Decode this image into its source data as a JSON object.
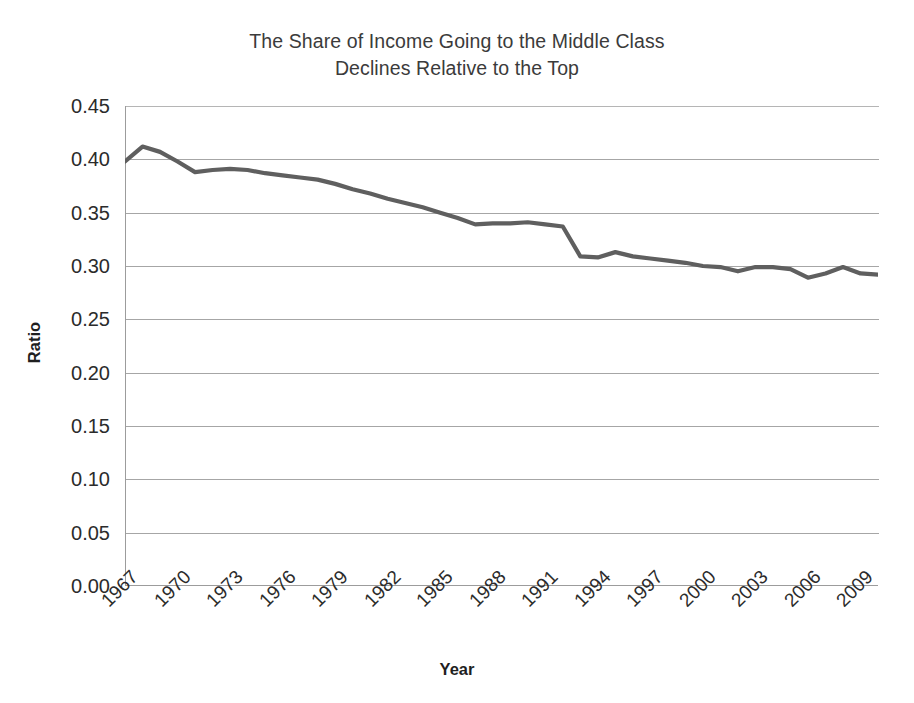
{
  "chart_data": {
    "type": "line",
    "title": "The Share of Income Going to the Middle Class Declines Relative to the Top",
    "title_lines": [
      "The Share of Income Going to the Middle Class",
      "Declines Relative to the Top"
    ],
    "xlabel": "Year",
    "ylabel": "Ratio",
    "ylim": [
      0.0,
      0.45
    ],
    "xlim": [
      1967,
      2010
    ],
    "ytick_step": 0.05,
    "ytick_labels": [
      "0.00",
      "0.05",
      "0.10",
      "0.15",
      "0.20",
      "0.25",
      "0.30",
      "0.35",
      "0.40",
      "0.45"
    ],
    "ytick_values": [
      0.0,
      0.05,
      0.1,
      0.15,
      0.2,
      0.25,
      0.3,
      0.35,
      0.4,
      0.45
    ],
    "xtick_labels": [
      "1967",
      "1970",
      "1973",
      "1976",
      "1979",
      "1982",
      "1985",
      "1988",
      "1991",
      "1994",
      "1997",
      "2000",
      "2003",
      "2006",
      "2009"
    ],
    "xtick_values": [
      1967,
      1970,
      1973,
      1976,
      1979,
      1982,
      1985,
      1988,
      1991,
      1994,
      1997,
      2000,
      2003,
      2006,
      2009
    ],
    "xtick_rotation": -45,
    "grid": true,
    "grid_axis": "y",
    "legend": false,
    "line_color": "#5f5f5f",
    "grid_color": "#a6a6a6",
    "axis_color": "#9c9c9c",
    "series": [
      {
        "name": "Ratio of middle class income share to top",
        "x": [
          1967,
          1968,
          1969,
          1970,
          1971,
          1972,
          1973,
          1974,
          1975,
          1976,
          1977,
          1978,
          1979,
          1980,
          1981,
          1982,
          1983,
          1984,
          1985,
          1986,
          1987,
          1988,
          1989,
          1990,
          1991,
          1992,
          1993,
          1994,
          1995,
          1996,
          1997,
          1998,
          1999,
          2000,
          2001,
          2002,
          2003,
          2004,
          2005,
          2006,
          2007,
          2008,
          2009,
          2010
        ],
        "values": [
          0.398,
          0.412,
          0.407,
          0.398,
          0.388,
          0.39,
          0.391,
          0.39,
          0.387,
          0.385,
          0.383,
          0.381,
          0.377,
          0.372,
          0.368,
          0.363,
          0.359,
          0.355,
          0.35,
          0.345,
          0.339,
          0.34,
          0.34,
          0.341,
          0.339,
          0.337,
          0.309,
          0.308,
          0.313,
          0.309,
          0.307,
          0.305,
          0.303,
          0.3,
          0.299,
          0.295,
          0.299,
          0.299,
          0.297,
          0.289,
          0.293,
          0.299,
          0.293,
          0.292
        ]
      }
    ]
  }
}
